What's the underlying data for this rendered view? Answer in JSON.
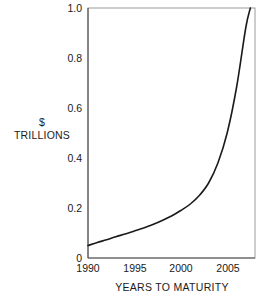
{
  "chart_data": {
    "type": "line",
    "title": "",
    "subtitle": "",
    "xlabel": "YEARS TO MATURITY",
    "ylabel": "$ TRILLIONS",
    "ylabel_lines": [
      "$",
      "TRILLIONS"
    ],
    "xlim": [
      1990,
      2008
    ],
    "ylim": [
      0,
      1.0
    ],
    "xticks": [
      1990,
      1995,
      2000,
      2005
    ],
    "xtick_labels": [
      "1990",
      "1995",
      "2000",
      "2005"
    ],
    "yticks": [
      0,
      0.2,
      0.4,
      0.6,
      0.8,
      1.0
    ],
    "ytick_labels": [
      "0",
      "0.2",
      "0.4",
      "0.6",
      "0.8",
      "1.0"
    ],
    "grid": false,
    "legend": false,
    "legend_position": "none",
    "line_color": "#1a1a1a",
    "line_width": 1.6,
    "frame_color": "#9a9a9a",
    "background": "#ffffff",
    "series": [
      {
        "name": "Debt maturing",
        "x": [
          1990,
          1991,
          1992,
          1993,
          1994,
          1995,
          1996,
          1997,
          1998,
          1999,
          2000,
          2001,
          2002,
          2003,
          2004,
          2005,
          2006,
          2007,
          2007.5
        ],
        "values": [
          0.05,
          0.062,
          0.073,
          0.085,
          0.096,
          0.108,
          0.12,
          0.134,
          0.15,
          0.168,
          0.19,
          0.215,
          0.25,
          0.3,
          0.38,
          0.5,
          0.68,
          0.92,
          1.0
        ]
      }
    ]
  },
  "axis": {
    "ylabel_line1": "$",
    "ylabel_line2": "TRILLIONS",
    "xlabel": "YEARS TO MATURITY"
  }
}
